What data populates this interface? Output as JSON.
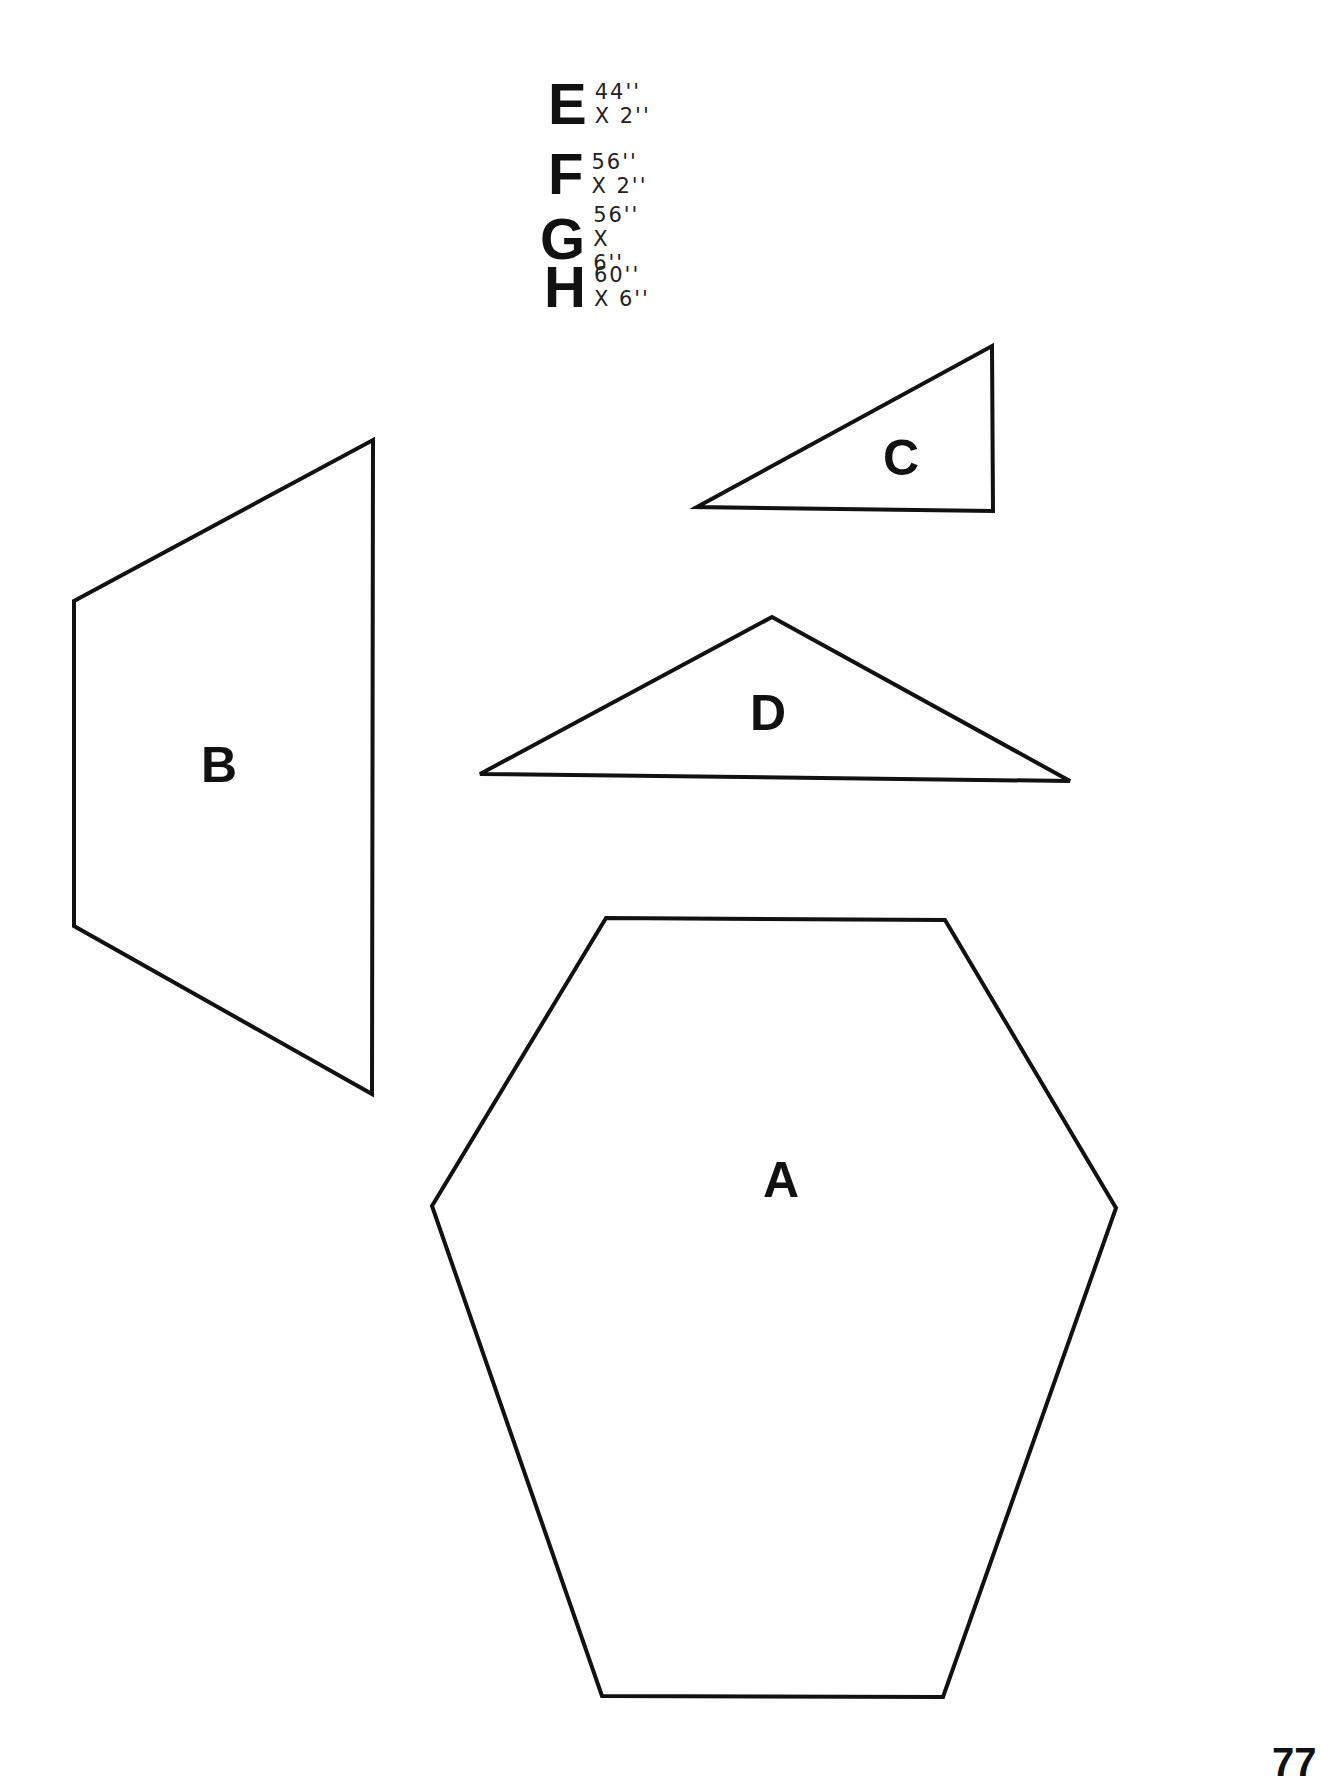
{
  "legend": {
    "items": [
      {
        "letter": "E",
        "dimensions": "44'' X 2''"
      },
      {
        "letter": "F",
        "dimensions": "56'' X 2''"
      },
      {
        "letter": "G",
        "dimensions": "56'' X 6''"
      },
      {
        "letter": "H",
        "dimensions": "60'' X 6''"
      }
    ]
  },
  "shapes": {
    "A": {
      "label": "A",
      "type": "hexagon",
      "points": "606,918 945,920 1116,1208 943,1697 602,1696 432,1206"
    },
    "B": {
      "label": "B",
      "type": "quadrilateral",
      "points": "74,601 373,440 372,1094 74,926"
    },
    "C": {
      "label": "C",
      "type": "right-triangle",
      "points": "697,507 992,346 993,511"
    },
    "D": {
      "label": "D",
      "type": "triangle",
      "points": "480,774 772,617 1070,781"
    }
  },
  "page": {
    "number": "77"
  },
  "colors": {
    "line": "#111111",
    "background": "#ffffff"
  }
}
